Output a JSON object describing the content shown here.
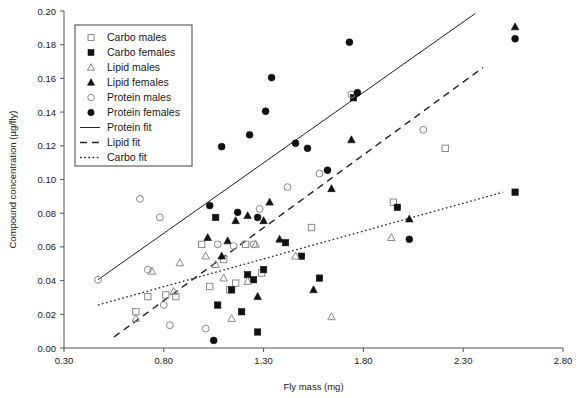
{
  "chart_data": {
    "type": "scatter",
    "title": "",
    "xlabel": "Fly mass (mg)",
    "ylabel": "Compound concentration (µg/fly)",
    "xlim": [
      0.3,
      2.8
    ],
    "ylim": [
      0.0,
      0.2
    ],
    "xticks": [
      "0.30",
      "0.80",
      "1.30",
      "1.80",
      "2.30",
      "2.80"
    ],
    "xtick_values": [
      0.3,
      0.8,
      1.3,
      1.8,
      2.3,
      2.8
    ],
    "yticks": [
      "0.00",
      "0.02",
      "0.04",
      "0.06",
      "0.08",
      "0.10",
      "0.12",
      "0.14",
      "0.16",
      "0.18",
      "0.20"
    ],
    "ytick_values": [
      0.0,
      0.02,
      0.04,
      0.06,
      0.08,
      0.1,
      0.12,
      0.14,
      0.16,
      0.18,
      0.2
    ],
    "grid": false,
    "legend_position": "top-left",
    "series": [
      {
        "name": "Carbo males",
        "marker": "open-square",
        "points": [
          [
            0.66,
            0.0215
          ],
          [
            0.72,
            0.0305
          ],
          [
            0.81,
            0.0315
          ],
          [
            0.86,
            0.0305
          ],
          [
            0.99,
            0.0615
          ],
          [
            1.03,
            0.0365
          ],
          [
            1.1,
            0.0525
          ],
          [
            1.13,
            0.0345
          ],
          [
            1.16,
            0.0385
          ],
          [
            1.21,
            0.0615
          ],
          [
            1.29,
            0.0445
          ],
          [
            1.54,
            0.0715
          ],
          [
            1.95,
            0.0865
          ],
          [
            2.21,
            0.1185
          ]
        ]
      },
      {
        "name": "Carbo females",
        "marker": "filled-square",
        "points": [
          [
            1.06,
            0.0775
          ],
          [
            1.07,
            0.0255
          ],
          [
            1.14,
            0.0345
          ],
          [
            1.19,
            0.0215
          ],
          [
            1.22,
            0.0435
          ],
          [
            1.25,
            0.0405
          ],
          [
            1.27,
            0.0095
          ],
          [
            1.3,
            0.0465
          ],
          [
            1.41,
            0.0625
          ],
          [
            1.49,
            0.0545
          ],
          [
            1.58,
            0.0415
          ],
          [
            1.75,
            0.1485
          ],
          [
            1.97,
            0.0835
          ],
          [
            2.56,
            0.0925
          ]
        ]
      },
      {
        "name": "Lipid males",
        "marker": "open-triangle",
        "points": [
          [
            0.66,
            0.0175
          ],
          [
            0.74,
            0.0455
          ],
          [
            0.85,
            0.0335
          ],
          [
            0.88,
            0.0505
          ],
          [
            1.01,
            0.0545
          ],
          [
            1.06,
            0.0495
          ],
          [
            1.1,
            0.0415
          ],
          [
            1.14,
            0.0175
          ],
          [
            1.22,
            0.0395
          ],
          [
            1.26,
            0.0615
          ],
          [
            1.46,
            0.0545
          ],
          [
            1.64,
            0.0185
          ],
          [
            1.94,
            0.0655
          ]
        ]
      },
      {
        "name": "Lipid females",
        "marker": "filled-triangle",
        "points": [
          [
            1.02,
            0.0655
          ],
          [
            1.09,
            0.0545
          ],
          [
            1.12,
            0.0635
          ],
          [
            1.16,
            0.0755
          ],
          [
            1.22,
            0.0785
          ],
          [
            1.27,
            0.0305
          ],
          [
            1.3,
            0.0755
          ],
          [
            1.33,
            0.0865
          ],
          [
            1.38,
            0.0645
          ],
          [
            1.55,
            0.0345
          ],
          [
            1.64,
            0.0945
          ],
          [
            1.74,
            0.1235
          ],
          [
            2.03,
            0.0765
          ],
          [
            2.56,
            0.1905
          ]
        ]
      },
      {
        "name": "Protein males",
        "marker": "open-circle",
        "points": [
          [
            0.47,
            0.0405
          ],
          [
            0.68,
            0.0885
          ],
          [
            0.72,
            0.0465
          ],
          [
            0.78,
            0.0775
          ],
          [
            0.8,
            0.0255
          ],
          [
            0.83,
            0.0135
          ],
          [
            1.01,
            0.0115
          ],
          [
            1.07,
            0.0615
          ],
          [
            1.15,
            0.0605
          ],
          [
            1.25,
            0.0615
          ],
          [
            1.28,
            0.0825
          ],
          [
            1.42,
            0.0955
          ],
          [
            1.58,
            0.1035
          ],
          [
            1.74,
            0.1505
          ],
          [
            2.1,
            0.1295
          ]
        ]
      },
      {
        "name": "Protein females",
        "marker": "filled-circle",
        "points": [
          [
            1.03,
            0.0845
          ],
          [
            1.05,
            0.0045
          ],
          [
            1.09,
            0.1195
          ],
          [
            1.17,
            0.0805
          ],
          [
            1.23,
            0.1265
          ],
          [
            1.27,
            0.0775
          ],
          [
            1.31,
            0.1405
          ],
          [
            1.34,
            0.1605
          ],
          [
            1.46,
            0.1215
          ],
          [
            1.52,
            0.1185
          ],
          [
            1.62,
            0.1055
          ],
          [
            1.73,
            0.1815
          ],
          [
            1.77,
            0.1515
          ],
          [
            2.03,
            0.0645
          ],
          [
            2.56,
            0.1835
          ]
        ]
      }
    ],
    "fits": [
      {
        "name": "Protein fit",
        "style": "solid",
        "x": [
          0.47,
          2.36
        ],
        "y": [
          0.0405,
          0.1985
        ]
      },
      {
        "name": "Lipid fit",
        "style": "dashed",
        "x": [
          0.55,
          2.4
        ],
        "y": [
          0.0065,
          0.1665
        ]
      },
      {
        "name": "Carbo fit",
        "style": "dotted",
        "x": [
          0.47,
          2.5
        ],
        "y": [
          0.0255,
          0.0925
        ]
      }
    ]
  },
  "legend": {
    "items": [
      {
        "label": "Carbo males",
        "marker": "open-square"
      },
      {
        "label": "Carbo females",
        "marker": "filled-square"
      },
      {
        "label": "Lipid males",
        "marker": "open-triangle"
      },
      {
        "label": "Lipid females",
        "marker": "filled-triangle"
      },
      {
        "label": "Protein males",
        "marker": "open-circle"
      },
      {
        "label": "Protein females",
        "marker": "filled-circle"
      },
      {
        "label": "Protein fit",
        "marker": "line-solid"
      },
      {
        "label": "Lipid fit",
        "marker": "line-dashed"
      },
      {
        "label": "Carbo fit",
        "marker": "line-dotted"
      }
    ]
  },
  "colors": {
    "axis": "#555555",
    "closed_marker": "#111111",
    "open_marker": "#8a8a8a",
    "fit_line": "#222222",
    "background": "#ffffff"
  }
}
